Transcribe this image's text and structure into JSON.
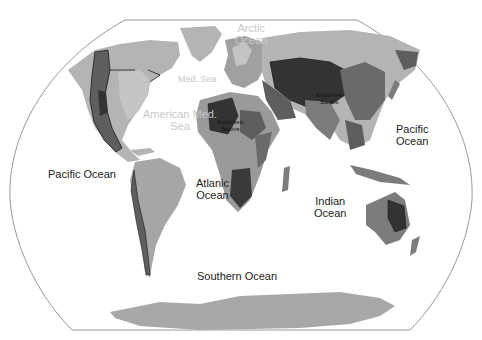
{
  "map": {
    "projection": "pseudo-cylindrical world map (elliptical frame)",
    "colors": {
      "background": "#ffffff",
      "frame": "#9a9a9a",
      "land_light": "#b4b4b4",
      "land_mid": "#8c8c8c",
      "land_dark": "#5e5e5e",
      "land_darkest": "#333333",
      "basin_border": "#1a1a1a"
    },
    "labels": {
      "arctic_ocean": "Arctic\nOcean",
      "arctic_ocean_line1": "Arctic",
      "arctic_ocean_line2": "Ocean",
      "med_sea": "Med. Sea",
      "american_med_sea_line1": "American Med.",
      "american_med_sea_line2": "Sea",
      "pacific_ocean_west": "Pacific Ocean",
      "pacific_ocean_east_line1": "Pacific",
      "pacific_ocean_east_line2": "Ocean",
      "atlantic_ocean_line1": "Atlanic",
      "atlantic_ocean_line2": "Ocean",
      "indian_ocean_line1": "Indian",
      "indian_ocean_line2": "Ocean",
      "southern_ocean": "Southern Ocean",
      "endorheic_africa_line1": "Endorheic",
      "endorheic_africa_line2": "Basins",
      "endorheic_asia_line1": "Endorheic",
      "endorheic_asia_line2": "Basins"
    }
  }
}
